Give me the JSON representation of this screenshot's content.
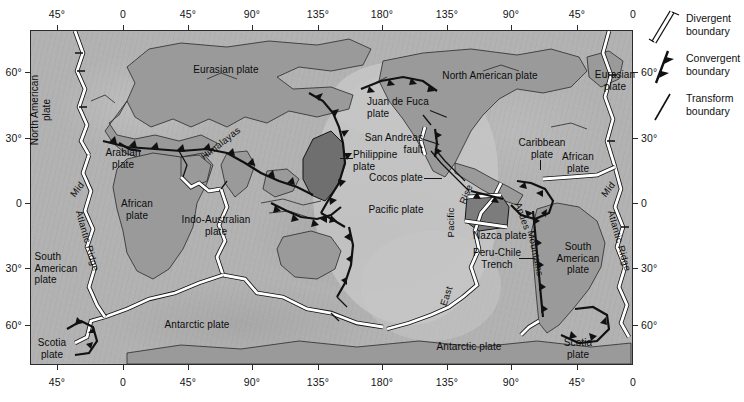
{
  "figure": {
    "colors": {
      "ocean": "#b2b2b2",
      "pacific_basin": "#c6c6c6",
      "continent": "#9a9a9a",
      "philippine_plate": "#6e6e6e",
      "cocos_plate": "#7a7a7a",
      "frame": "#2b2b2b",
      "boundary": "#111111",
      "divergent_fill": "#ffffff",
      "text": "#111111"
    }
  },
  "axes": {
    "top_labels": [
      "45°",
      "0",
      "45°",
      "90°",
      "135°",
      "180°",
      "135°",
      "90°",
      "45°",
      "0"
    ],
    "bottom_labels": [
      "45°",
      "0",
      "45°",
      "90°",
      "135°",
      "180°",
      "135°",
      "90°",
      "45°",
      "0"
    ],
    "left_labels": [
      "60°",
      "30°",
      "0",
      "30°",
      "60°"
    ],
    "right_labels": [
      "60°",
      "30°",
      "0",
      "30°",
      "60°"
    ],
    "longitude_positions_px": [
      57,
      123,
      188,
      252,
      318,
      382,
      447,
      511,
      577,
      633
    ],
    "latitude_positions_px": [
      72,
      138,
      203,
      268,
      325
    ]
  },
  "legend": {
    "items": [
      {
        "symbol": "divergent-boundary-symbol",
        "label": "Divergent\nboundary"
      },
      {
        "symbol": "convergent-boundary-symbol",
        "label": "Convergent\nboundary"
      },
      {
        "symbol": "transform-boundary-symbol",
        "label": "Transform\nboundary"
      }
    ]
  },
  "plate_labels": [
    {
      "name": "north-american-plate-left",
      "text": "North American\nplate",
      "x": 40,
      "y": 110,
      "rotate": -90,
      "align": "center"
    },
    {
      "name": "eurasian-plate",
      "text": "Eurasian plate",
      "x": 226,
      "y": 70,
      "rotate": 0,
      "align": "center"
    },
    {
      "name": "arabian-plate",
      "text": "Arabian\nplate",
      "x": 123,
      "y": 158,
      "rotate": 0,
      "align": "center"
    },
    {
      "name": "african-plate",
      "text": "African\nplate",
      "x": 137,
      "y": 209,
      "rotate": 0,
      "align": "center"
    },
    {
      "name": "indo-australian-plate",
      "text": "Indo-Australian\nplate",
      "x": 216,
      "y": 225,
      "rotate": 0,
      "align": "center"
    },
    {
      "name": "philippine-plate",
      "text": "Philippine\nplate",
      "x": 353,
      "y": 160,
      "rotate": 0,
      "align": "left"
    },
    {
      "name": "pacific-plate",
      "text": "Pacific plate",
      "x": 396,
      "y": 210,
      "rotate": 0,
      "align": "center"
    },
    {
      "name": "juan-de-fuca-plate",
      "text": "Juan de Fuca\nplate",
      "x": 367,
      "y": 107,
      "rotate": 0,
      "align": "left"
    },
    {
      "name": "north-american-plate",
      "text": "North American plate",
      "x": 490,
      "y": 76,
      "rotate": 0,
      "align": "center"
    },
    {
      "name": "san-andreas-fault",
      "text": "San Andreas\nfault",
      "x": 423,
      "y": 143,
      "rotate": 0,
      "align": "left"
    },
    {
      "name": "cocos-plate",
      "text": "Cocos plate",
      "x": 423,
      "y": 178,
      "rotate": 0,
      "align": "left"
    },
    {
      "name": "caribbean-plate",
      "text": "Caribbean\nplate",
      "x": 542,
      "y": 148,
      "rotate": 0,
      "align": "center"
    },
    {
      "name": "eurasian-plate-right",
      "text": "Eurasian\nplate",
      "x": 615,
      "y": 80,
      "rotate": 0,
      "align": "center"
    },
    {
      "name": "african-plate-right",
      "text": "African\nplate",
      "x": 578,
      "y": 162,
      "rotate": 0,
      "align": "center"
    },
    {
      "name": "nazca-plate",
      "text": "Nazca plate",
      "x": 500,
      "y": 236,
      "rotate": 0,
      "align": "center"
    },
    {
      "name": "peru-chile-trench",
      "text": "Peru-Chile\nTrench",
      "x": 497,
      "y": 258,
      "rotate": 0,
      "align": "center"
    },
    {
      "name": "south-american-plate",
      "text": "South\nAmerican\nplate",
      "x": 578,
      "y": 258,
      "rotate": 0,
      "align": "center"
    },
    {
      "name": "south-american-plate-left",
      "text": "South\nAmerican\nplate",
      "x": 56,
      "y": 268,
      "rotate": 0,
      "align": "center"
    },
    {
      "name": "antarctic-plate-left",
      "text": "Antarctic plate",
      "x": 197,
      "y": 325,
      "rotate": 0,
      "align": "center"
    },
    {
      "name": "antarctic-plate-right",
      "text": "Antarctic plate",
      "x": 469,
      "y": 347,
      "rotate": 0,
      "align": "center"
    },
    {
      "name": "scotia-plate-left",
      "text": "Scotia\nplate",
      "x": 52,
      "y": 348,
      "rotate": 0,
      "align": "center"
    },
    {
      "name": "scotia-plate-right",
      "text": "Scotia\nplate",
      "x": 578,
      "y": 348,
      "rotate": 0,
      "align": "center"
    }
  ],
  "feature_labels": [
    {
      "name": "himalayas",
      "text": "Himalayas",
      "x": 202,
      "y": 152,
      "rotate": -38
    },
    {
      "name": "mid-atlantic-ridge-left",
      "text": "Mid",
      "x": 72,
      "y": 190,
      "rotate": -52
    },
    {
      "name": "mid-atlantic-ridge-left2",
      "text": "Atlantic Ridge",
      "x": 79,
      "y": 205,
      "rotate": 74
    },
    {
      "name": "mid-atlantic-ridge-right",
      "text": "Mid",
      "x": 603,
      "y": 190,
      "rotate": -52
    },
    {
      "name": "mid-atlantic-ridge-right2",
      "text": "Atlantic Ridge",
      "x": 611,
      "y": 205,
      "rotate": 74
    },
    {
      "name": "east-pacific-rise-rise",
      "text": "Rise",
      "x": 462,
      "y": 198,
      "rotate": -68
    },
    {
      "name": "east-pacific-rise-pacific",
      "text": "Pacific",
      "x": 450,
      "y": 232,
      "rotate": -90
    },
    {
      "name": "east-pacific-rise-east",
      "text": "East",
      "x": 443,
      "y": 300,
      "rotate": -72
    },
    {
      "name": "andes",
      "text": "Andes",
      "x": 518,
      "y": 197,
      "rotate": 70
    },
    {
      "name": "andes-mountains",
      "text": "Mountains",
      "x": 531,
      "y": 225,
      "rotate": 78
    }
  ]
}
